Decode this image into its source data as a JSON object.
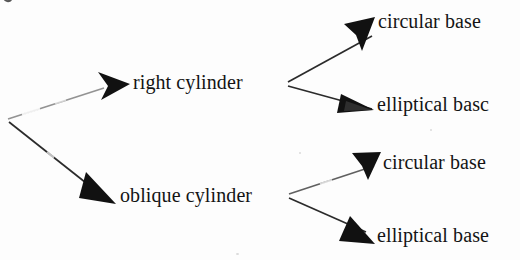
{
  "diagram": {
    "style": {
      "background_color": "#fdfdfd",
      "ink_color": "#141414",
      "line_color": "#2b2b2b",
      "arrowhead_color": "#111111"
    },
    "root": {
      "label": "",
      "fork_point": [
        8,
        120
      ]
    },
    "nodes": [
      {
        "id": "right-cylinder",
        "label": "right cylinder",
        "level": 1,
        "x": 133,
        "y": 83
      },
      {
        "id": "oblique-cylinder",
        "label": "oblique cylinder",
        "level": 1,
        "x": 120,
        "y": 196
      },
      {
        "id": "right-circular-base",
        "label": "circular base",
        "level": 2,
        "parent": "right-cylinder",
        "x": 378,
        "y": 22
      },
      {
        "id": "right-elliptical-base",
        "label": "elliptical basc",
        "level": 2,
        "parent": "right-cylinder",
        "x": 377,
        "y": 105
      },
      {
        "id": "oblique-circular-base",
        "label": "circular base",
        "level": 2,
        "parent": "oblique-cylinder",
        "x": 383,
        "y": 163
      },
      {
        "id": "oblique-elliptical-base",
        "label": "elliptical base",
        "level": 2,
        "parent": "oblique-cylinder",
        "x": 377,
        "y": 236
      }
    ],
    "edges": [
      {
        "id": "root-to-right",
        "from": "root",
        "to": "right-cylinder",
        "style": "solid-faded"
      },
      {
        "id": "root-to-oblique",
        "from": "root",
        "to": "oblique-cylinder",
        "style": "solid"
      },
      {
        "id": "right-to-circular",
        "from": "right-cylinder",
        "to": "right-circular-base",
        "style": "solid"
      },
      {
        "id": "right-to-elliptical",
        "from": "right-cylinder",
        "to": "right-elliptical-base",
        "style": "solid"
      },
      {
        "id": "oblique-to-circular",
        "from": "oblique-cylinder",
        "to": "oblique-circular-base",
        "style": "solid-faded"
      },
      {
        "id": "oblique-to-elliptical",
        "from": "oblique-cylinder",
        "to": "oblique-elliptical-base",
        "style": "solid"
      }
    ],
    "artifacts": [
      {
        "id": "clipped-descender",
        "description": "partial glyph tail clipped at top-left edge of scan"
      }
    ]
  }
}
